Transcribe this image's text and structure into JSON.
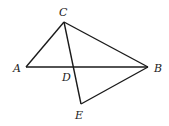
{
  "diagram": {
    "points": {
      "A": {
        "label": "A",
        "x": 26,
        "y": 67,
        "lx": 13,
        "ly": 72
      },
      "B": {
        "label": "B",
        "x": 148,
        "y": 67,
        "lx": 154,
        "ly": 72
      },
      "C": {
        "label": "C",
        "x": 64,
        "y": 22,
        "lx": 59,
        "ly": 16
      },
      "D": {
        "label": "D",
        "x": 72,
        "y": 67,
        "lx": 62,
        "ly": 81
      },
      "E": {
        "label": "E",
        "x": 81,
        "y": 104,
        "lx": 75,
        "ly": 119
      }
    },
    "segments": [
      [
        "A",
        "C"
      ],
      [
        "C",
        "B"
      ],
      [
        "A",
        "B"
      ],
      [
        "C",
        "E"
      ],
      [
        "E",
        "B"
      ]
    ],
    "stroke_color": "#1a1a1a"
  }
}
